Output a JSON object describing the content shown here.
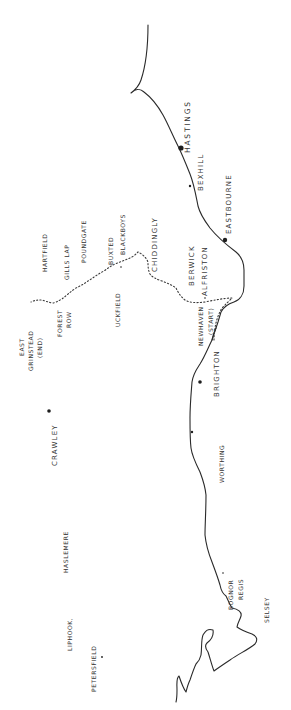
{
  "map": {
    "style": "hand-drawn sketch",
    "orientation": "rotated 90 degrees counter-clockwise (north at left)",
    "colors": {
      "ink": "#2a2a2a",
      "paper": "#ffffff"
    },
    "route_style": "dotted line",
    "places": {
      "hastings": "HASTINGS",
      "bexhill": "BEXHILL",
      "eastbourne": "EASTBOURNE",
      "chiddingly": "CHIDDINGLY",
      "berwick": "BERWICK",
      "alfriston": "ALFRISTON",
      "newhaven": "NEWHAVEN",
      "newhaven_note": "(START)",
      "brighton": "BRIGHTON",
      "worthing": "WORTHING",
      "bognor_line1": "BOGNOR",
      "bognor_line2": "REGIS",
      "selsey": "SELSEY",
      "buxted": "BUXTED",
      "blackboys": "BLACKBOYS",
      "uckfield": "UCKFIELD",
      "poundgate": "POUNDGATE",
      "gills_lap": "GILLS LAP",
      "hartfield": "HARTFIELD",
      "forest_row_line1": "FOREST",
      "forest_row_line2": "ROW",
      "east_grinstead_line1": "EAST",
      "east_grinstead_line2": "GRINSTEAD",
      "east_grinstead_line3": "(END)",
      "crawley": "CRAWLEY",
      "haslemere": "HASLEMERE",
      "liphook": "LIPHOOK,",
      "petersfield": "PETERSFIELD"
    }
  }
}
